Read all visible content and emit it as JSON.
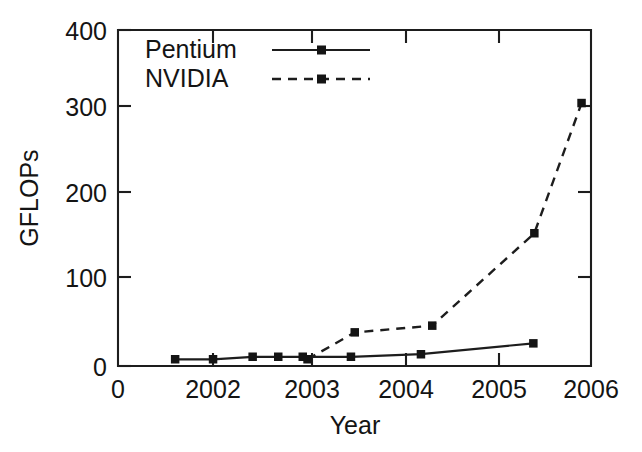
{
  "chart_data": {
    "type": "line",
    "title": "",
    "xlabel": "Year",
    "ylabel": "GFLOPs",
    "xlim": [
      0,
      2006.6
    ],
    "ylim": [
      0,
      400
    ],
    "grid": false,
    "legend_position": "top-left-inside",
    "x_ticks": [
      {
        "value": 0,
        "label": "0",
        "px": 118
      },
      {
        "value": 2002,
        "label": "2002",
        "px": 213
      },
      {
        "value": 2003,
        "label": "2003",
        "px": 312
      },
      {
        "value": 2004,
        "label": "2004",
        "px": 406
      },
      {
        "value": 2005,
        "label": "2005",
        "px": 499
      },
      {
        "value": 2006,
        "label": "2006",
        "px": 591
      }
    ],
    "y_ticks": [
      {
        "value": 0,
        "label": "0",
        "px": 366
      },
      {
        "value": 100,
        "label": "100",
        "px": 277
      },
      {
        "value": 200,
        "label": "200",
        "px": 192
      },
      {
        "value": 300,
        "label": "300",
        "px": 106
      },
      {
        "value": 400,
        "label": "400",
        "px": 30
      }
    ],
    "series": [
      {
        "name": "Pentium",
        "style": "solid",
        "marker": "square",
        "points": [
          {
            "x": 2001.6,
            "y": 8
          },
          {
            "x": 2002.0,
            "y": 8
          },
          {
            "x": 2002.42,
            "y": 11
          },
          {
            "x": 2002.69,
            "y": 11
          },
          {
            "x": 2002.95,
            "y": 11
          },
          {
            "x": 2003.46,
            "y": 11
          },
          {
            "x": 2004.2,
            "y": 14
          },
          {
            "x": 2005.39,
            "y": 27
          }
        ]
      },
      {
        "name": "NVIDIA",
        "style": "dashed",
        "marker": "square",
        "points": [
          {
            "x": 2003.0,
            "y": 8
          },
          {
            "x": 2003.5,
            "y": 40
          },
          {
            "x": 2004.32,
            "y": 48
          },
          {
            "x": 2005.4,
            "y": 158
          },
          {
            "x": 2005.9,
            "y": 313
          }
        ]
      }
    ],
    "legend": [
      {
        "label": "Pentium",
        "style": "solid",
        "marker": "square"
      },
      {
        "label": "NVIDIA",
        "style": "dashed",
        "marker": "square"
      }
    ],
    "colors": {
      "axis": "#1d1d1d",
      "series_pentium": "#1d1d1d",
      "series_nvidia": "#1d1d1d",
      "background": "#ffffff"
    }
  }
}
